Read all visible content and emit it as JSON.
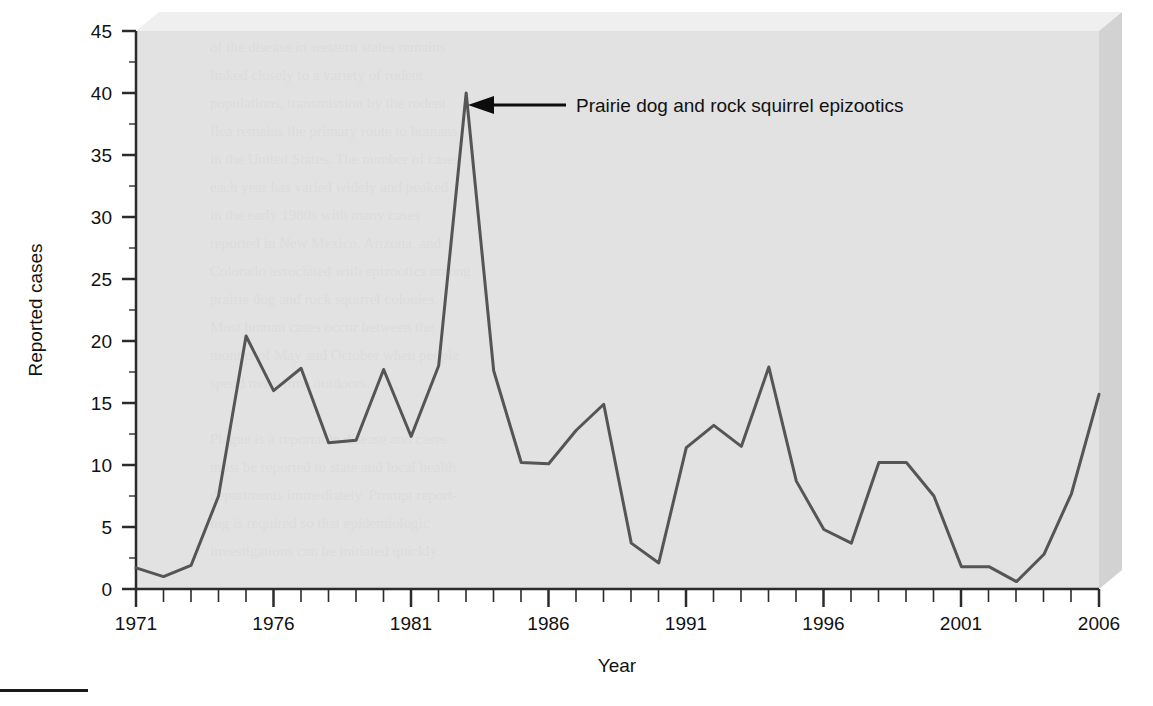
{
  "figure": {
    "background_color": "#ffffff",
    "panel_color": "#e2e2e2",
    "panel_top_bevel_color": "#efefef",
    "panel_side_bevel_color": "#d2d2d2",
    "line_color": "#555555",
    "axis_color": "#2b2b2b",
    "text_color": "#111111",
    "footer_rule_color": "#1a1a1a"
  },
  "annotation": {
    "label": "Prairie dog and rock squirrel epizootics",
    "points_to_year": 1983,
    "points_to_value": 40
  },
  "chart_data": {
    "type": "line",
    "title": "",
    "xlabel": "Year",
    "ylabel": "Reported cases",
    "xlim": [
      1971,
      2006
    ],
    "ylim": [
      0,
      45
    ],
    "ytick_step": 5,
    "yticks": [
      0,
      5,
      10,
      15,
      20,
      25,
      30,
      35,
      40,
      45
    ],
    "xticks_major": [
      1971,
      1976,
      1981,
      1986,
      1991,
      1996,
      2001,
      2006
    ],
    "xticks_minor_every": 1,
    "grid": false,
    "legend": null,
    "x": [
      1971,
      1972,
      1973,
      1974,
      1975,
      1976,
      1977,
      1978,
      1979,
      1980,
      1981,
      1982,
      1983,
      1984,
      1985,
      1986,
      1987,
      1988,
      1989,
      1990,
      1991,
      1992,
      1993,
      1994,
      1995,
      1996,
      1997,
      1998,
      1999,
      2000,
      2001,
      2002,
      2003,
      2004,
      2005,
      2006
    ],
    "values": [
      1.7,
      1.0,
      1.9,
      7.5,
      20.4,
      16.0,
      17.8,
      11.8,
      12.0,
      17.7,
      12.3,
      18.0,
      40.0,
      17.6,
      10.2,
      10.1,
      12.8,
      14.9,
      3.7,
      2.1,
      11.4,
      13.2,
      11.5,
      17.9,
      8.7,
      4.8,
      3.7,
      10.2,
      10.2,
      7.5,
      1.8,
      1.8,
      0.6,
      2.8,
      7.7,
      15.7
    ],
    "series": [
      {
        "name": "Reported cases",
        "values": [
          1.7,
          1.0,
          1.9,
          7.5,
          20.4,
          16.0,
          17.8,
          11.8,
          12.0,
          17.7,
          12.3,
          18.0,
          40.0,
          17.6,
          10.2,
          10.1,
          12.8,
          14.9,
          3.7,
          2.1,
          11.4,
          13.2,
          11.5,
          17.9,
          8.7,
          4.8,
          3.7,
          10.2,
          10.2,
          7.5,
          1.8,
          1.8,
          0.6,
          2.8,
          7.7,
          15.7
        ]
      }
    ]
  },
  "axis": {
    "y_tick_labels": [
      "45",
      "40",
      "35",
      "30",
      "25",
      "20",
      "15",
      "10",
      "5",
      "0"
    ],
    "x_tick_labels": [
      "1971",
      "1976",
      "1981",
      "1986",
      "1991",
      "1996",
      "2001",
      "2006"
    ],
    "y_title": "Reported cases",
    "x_title": "Year"
  }
}
